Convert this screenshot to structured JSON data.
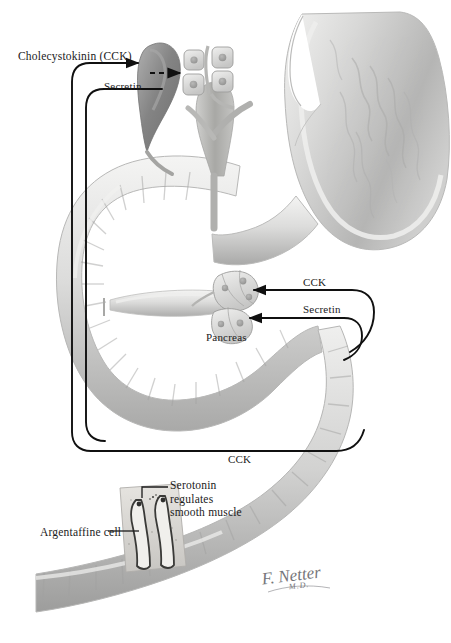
{
  "figure": {
    "signature": "F. Netter",
    "signature_suffix": "M.D."
  },
  "labels": {
    "cck_top": "Cholecystokinin (CCK)",
    "secretin_top": "Secretin",
    "cck_right": "CCK",
    "secretin_right": "Secretin",
    "pancreas": "Pancreas",
    "cck_bottom": "CCK",
    "serotonin_line1": "Serotonin",
    "serotonin_line2": "regulates",
    "serotonin_line3": "smooth muscle",
    "argentaffine": "Argentaffine cell"
  },
  "colors": {
    "background": "#ffffff",
    "ink": "#1b1b1b",
    "tissue_light": "#e7e7e6",
    "tissue_mid": "#c9c9c8",
    "tissue_dark": "#9a9a9a",
    "gallbladder": "#8d8d8d",
    "duct": "#b4b4b2",
    "signature": "#5d5d63"
  },
  "structures": [
    {
      "name": "stomach",
      "description": "Stomach shown in cross-section with rugae"
    },
    {
      "name": "duodenum",
      "description": "Duodenal C-loop with circular folds"
    },
    {
      "name": "jejunum",
      "description": "Lower small-intestine segment with plicae circulares"
    },
    {
      "name": "gallbladder",
      "description": "Pear-shaped gallbladder with cystic duct"
    },
    {
      "name": "bile-duct-tree",
      "description": "Common bile duct branching to hepatic ducts"
    },
    {
      "name": "liver-cell-cluster",
      "description": "Four cuboidal liver cells around bile canaliculus"
    },
    {
      "name": "pancreas-acini",
      "description": "Pancreatic acinar cell clusters with nuclei"
    },
    {
      "name": "pancreatic-duct",
      "description": "Pancreatic duct entering duodenum"
    },
    {
      "name": "argentaffine-cell-inset",
      "description": "Magnified mucosal inset with two argentaffine cells"
    }
  ],
  "pathways": [
    {
      "name": "cck-to-gallbladder",
      "from": "duodenum",
      "to": "gallbladder",
      "hormone": "CCK"
    },
    {
      "name": "secretin-to-liver-cells",
      "from": "duodenum",
      "to": "liver cells",
      "hormone": "Secretin",
      "style": "dashed"
    },
    {
      "name": "cck-to-pancreas",
      "from": "duodenum",
      "to": "pancreas",
      "hormone": "CCK"
    },
    {
      "name": "secretin-to-pancreas",
      "from": "duodenum",
      "to": "pancreas",
      "hormone": "Secretin"
    }
  ]
}
